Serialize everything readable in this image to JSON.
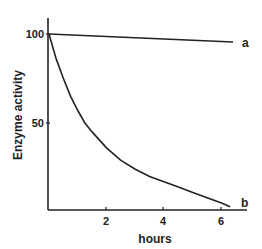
{
  "chart_data": {
    "type": "line",
    "title": "",
    "xlabel": "hours",
    "ylabel": "Enzyme activity",
    "xlim": [
      0,
      6.8
    ],
    "ylim": [
      0,
      110
    ],
    "xticks": [
      2,
      4,
      6
    ],
    "yticks": [
      50,
      100
    ],
    "grid": false,
    "legend": "inline labels at line ends",
    "series": [
      {
        "name": "a",
        "x": [
          0,
          2,
          4,
          6,
          6.4
        ],
        "values": [
          100,
          98.6,
          97.2,
          95.8,
          95.5
        ]
      },
      {
        "name": "b",
        "x": [
          0,
          0.25,
          0.5,
          0.75,
          1,
          1.25,
          1.5,
          2,
          2.5,
          3,
          3.5,
          4,
          4.5,
          5,
          5.5,
          6,
          6.3
        ],
        "values": [
          100,
          86,
          75,
          65,
          57,
          50,
          45,
          36,
          29,
          24,
          20,
          17,
          14,
          11,
          8,
          5,
          3
        ]
      }
    ]
  },
  "labels": {
    "ylabel": "Enzyme activity",
    "xlabel": "hours",
    "ytick_100": "100",
    "ytick_50": "50",
    "xtick_2": "2",
    "xtick_4": "4",
    "xtick_6": "6",
    "series_a": "a",
    "series_b": "b"
  }
}
